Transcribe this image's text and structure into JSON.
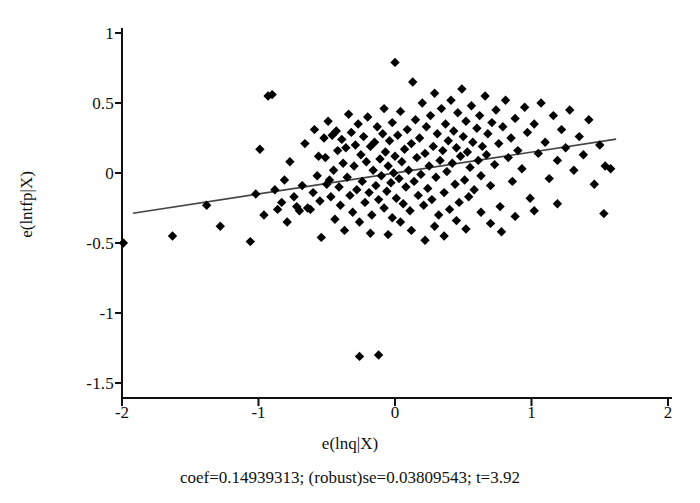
{
  "figure": {
    "width": 700,
    "height": 503,
    "background": "#ffffff",
    "ink_color": "#111111"
  },
  "axes": {
    "x_label": "e(lnq|X)",
    "y_label": "e(lntfp|X)",
    "x_ticks": [
      "-2",
      "-1",
      "0",
      "1",
      "2"
    ],
    "y_ticks": [
      "1",
      "0.5",
      "0",
      "-0.5",
      "-1",
      "-1.5"
    ]
  },
  "caption": {
    "text": "coef=0.14939313; (robust)se=0.03809543; t=3.92"
  },
  "chart_data": {
    "type": "scatter",
    "title": "",
    "xlabel": "e(lnq|X)",
    "ylabel": "e(lntfp|X)",
    "xlim": [
      -2,
      2
    ],
    "ylim": [
      -1.5,
      1
    ],
    "xticks": [
      -2,
      -1,
      0,
      1,
      2
    ],
    "yticks": [
      1,
      0.5,
      0,
      -0.5,
      -1,
      -1.5
    ],
    "grid": false,
    "legend": false,
    "marker": "diamond",
    "marker_color": "#000000",
    "marker_size": 7,
    "fit_line": {
      "type": "linear",
      "coef": 0.14939313,
      "robust_se": 0.03809543,
      "t": 3.92,
      "intercept": 0.0,
      "color": "#444444",
      "x_start": -1.92,
      "x_end": 1.62,
      "y_start": -0.287,
      "y_end": 0.242
    },
    "series": [
      {
        "name": "partial residuals",
        "n": 196,
        "points": [
          [
            -1.99,
            -0.5
          ],
          [
            -1.63,
            -0.45
          ],
          [
            -1.38,
            -0.23
          ],
          [
            -1.28,
            -0.38
          ],
          [
            -1.06,
            -0.49
          ],
          [
            -1.02,
            -0.15
          ],
          [
            -0.99,
            0.17
          ],
          [
            -0.96,
            -0.3
          ],
          [
            -0.93,
            0.55
          ],
          [
            -0.9,
            0.56
          ],
          [
            -0.88,
            -0.12
          ],
          [
            -0.86,
            -0.26
          ],
          [
            -0.83,
            -0.21
          ],
          [
            -0.81,
            -0.05
          ],
          [
            -0.79,
            -0.35
          ],
          [
            -0.77,
            0.08
          ],
          [
            -0.74,
            -0.17
          ],
          [
            -0.72,
            -0.24
          ],
          [
            -0.7,
            -0.27
          ],
          [
            -0.68,
            -0.09
          ],
          [
            -0.66,
            0.21
          ],
          [
            -0.64,
            -0.25
          ],
          [
            -0.62,
            -0.26
          ],
          [
            -0.6,
            -0.14
          ],
          [
            -0.59,
            0.31
          ],
          [
            -0.57,
            -0.02
          ],
          [
            -0.56,
            0.12
          ],
          [
            -0.55,
            -0.2
          ],
          [
            -0.54,
            -0.46
          ],
          [
            -0.52,
            0.25
          ],
          [
            -0.51,
            0.11
          ],
          [
            -0.5,
            -0.08
          ],
          [
            -0.49,
            0.37
          ],
          [
            -0.48,
            -0.05
          ],
          [
            -0.47,
            -0.17
          ],
          [
            -0.46,
            0.27
          ],
          [
            -0.45,
            0.02
          ],
          [
            -0.44,
            -0.33
          ],
          [
            -0.43,
            0.3
          ],
          [
            -0.42,
            0.16
          ],
          [
            -0.41,
            -0.1
          ],
          [
            -0.4,
            -0.23
          ],
          [
            -0.39,
            0.24
          ],
          [
            -0.38,
            0.07
          ],
          [
            -0.37,
            -0.41
          ],
          [
            -0.36,
            0.18
          ],
          [
            -0.35,
            -0.03
          ],
          [
            -0.34,
            0.42
          ],
          [
            -0.33,
            -0.16
          ],
          [
            -0.32,
            0.29
          ],
          [
            -0.31,
            -0.28
          ],
          [
            -0.3,
            0.05
          ],
          [
            -0.29,
            0.2
          ],
          [
            -0.28,
            -0.12
          ],
          [
            -0.27,
            0.35
          ],
          [
            -0.26,
            -0.35
          ],
          [
            -0.26,
            -1.31
          ],
          [
            -0.25,
            0.13
          ],
          [
            -0.24,
            -0.06
          ],
          [
            -0.23,
            0.26
          ],
          [
            -0.22,
            -0.21
          ],
          [
            -0.21,
            0.08
          ],
          [
            -0.2,
            0.4
          ],
          [
            -0.19,
            -0.14
          ],
          [
            -0.18,
            0.19
          ],
          [
            -0.17,
            -0.3
          ],
          [
            -0.16,
            0.02
          ],
          [
            -0.15,
            0.22
          ],
          [
            -0.14,
            -0.09
          ],
          [
            -0.13,
            0.33
          ],
          [
            -0.12,
            -0.19
          ],
          [
            -0.12,
            -1.3
          ],
          [
            -0.11,
            0.1
          ],
          [
            -0.1,
            -0.02
          ],
          [
            -0.09,
            0.28
          ],
          [
            -0.08,
            -0.25
          ],
          [
            -0.08,
            0.46
          ],
          [
            -0.07,
            0.15
          ],
          [
            -0.06,
            -0.13
          ],
          [
            -0.05,
            0.05
          ],
          [
            -0.04,
            0.23
          ],
          [
            -0.03,
            -0.07
          ],
          [
            -0.02,
            0.36
          ],
          [
            -0.02,
            -0.32
          ],
          [
            -0.01,
            0.0
          ],
          [
            0.0,
            0.79
          ],
          [
            0.0,
            0.12
          ],
          [
            0.01,
            -0.18
          ],
          [
            0.02,
            0.27
          ],
          [
            0.03,
            -0.04
          ],
          [
            0.04,
            0.44
          ],
          [
            0.05,
            0.08
          ],
          [
            0.06,
            -0.22
          ],
          [
            0.07,
            0.17
          ],
          [
            0.08,
            -0.1
          ],
          [
            0.09,
            0.31
          ],
          [
            0.1,
            0.02
          ],
          [
            0.11,
            -0.27
          ],
          [
            0.12,
            0.21
          ],
          [
            0.13,
            0.65
          ],
          [
            0.14,
            -0.06
          ],
          [
            0.15,
            0.38
          ],
          [
            0.16,
            0.11
          ],
          [
            0.17,
            -0.16
          ],
          [
            0.18,
            0.25
          ],
          [
            0.19,
            -0.01
          ],
          [
            0.2,
            0.5
          ],
          [
            0.21,
            -0.23
          ],
          [
            0.22,
            0.14
          ],
          [
            0.23,
            0.33
          ],
          [
            0.24,
            -0.11
          ],
          [
            0.25,
            0.05
          ],
          [
            0.26,
            0.41
          ],
          [
            0.27,
            -0.19
          ],
          [
            0.28,
            0.19
          ],
          [
            0.29,
            0.57
          ],
          [
            0.3,
            -0.03
          ],
          [
            0.31,
            0.28
          ],
          [
            0.32,
            -0.3
          ],
          [
            0.33,
            0.09
          ],
          [
            0.34,
            0.46
          ],
          [
            0.35,
            0.16
          ],
          [
            0.36,
            -0.14
          ],
          [
            0.37,
            0.35
          ],
          [
            0.38,
            0.01
          ],
          [
            0.39,
            0.23
          ],
          [
            0.4,
            -0.26
          ],
          [
            0.41,
            0.52
          ],
          [
            0.42,
            0.07
          ],
          [
            0.43,
            0.3
          ],
          [
            0.44,
            -0.08
          ],
          [
            0.45,
            0.18
          ],
          [
            0.46,
            0.43
          ],
          [
            0.47,
            -0.21
          ],
          [
            0.48,
            0.12
          ],
          [
            0.49,
            0.6
          ],
          [
            0.5,
            0.26
          ],
          [
            0.51,
            -0.05
          ],
          [
            0.52,
            0.37
          ],
          [
            0.53,
            0.15
          ],
          [
            0.54,
            -0.17
          ],
          [
            0.55,
            0.04
          ],
          [
            0.56,
            0.48
          ],
          [
            0.57,
            0.22
          ],
          [
            0.58,
            -0.12
          ],
          [
            0.6,
            0.32
          ],
          [
            0.61,
            0.09
          ],
          [
            0.62,
            0.41
          ],
          [
            0.63,
            -0.02
          ],
          [
            0.64,
            0.19
          ],
          [
            0.66,
            0.55
          ],
          [
            0.67,
            0.13
          ],
          [
            0.68,
            0.28
          ],
          [
            0.7,
            -0.09
          ],
          [
            0.71,
            0.36
          ],
          [
            0.73,
            0.06
          ],
          [
            0.74,
            0.45
          ],
          [
            0.76,
            0.21
          ],
          [
            0.77,
            -0.24
          ],
          [
            0.79,
            0.33
          ],
          [
            0.81,
            0.52
          ],
          [
            0.83,
            0.11
          ],
          [
            0.85,
            0.25
          ],
          [
            0.86,
            -0.06
          ],
          [
            0.88,
            0.39
          ],
          [
            0.9,
            0.16
          ],
          [
            0.93,
            0.03
          ],
          [
            0.95,
            0.47
          ],
          [
            0.97,
            0.29
          ],
          [
            0.99,
            -0.18
          ],
          [
            1.02,
            0.35
          ],
          [
            1.05,
            0.14
          ],
          [
            1.07,
            0.5
          ],
          [
            1.1,
            0.22
          ],
          [
            1.13,
            -0.04
          ],
          [
            1.16,
            0.41
          ],
          [
            1.19,
            0.09
          ],
          [
            1.22,
            0.31
          ],
          [
            1.25,
            0.18
          ],
          [
            1.28,
            0.45
          ],
          [
            1.31,
            0.02
          ],
          [
            1.35,
            0.26
          ],
          [
            1.38,
            0.13
          ],
          [
            1.42,
            0.38
          ],
          [
            1.46,
            -0.08
          ],
          [
            1.5,
            0.2
          ],
          [
            1.54,
            0.05
          ],
          [
            1.58,
            0.03
          ],
          [
            1.53,
            -0.29
          ],
          [
            1.19,
            -0.22
          ],
          [
            0.88,
            -0.31
          ],
          [
            0.63,
            -0.28
          ],
          [
            0.45,
            -0.34
          ],
          [
            0.29,
            -0.38
          ],
          [
            0.12,
            -0.41
          ],
          [
            -0.05,
            -0.44
          ],
          [
            0.36,
            -0.45
          ],
          [
            0.52,
            -0.4
          ],
          [
            0.7,
            -0.36
          ],
          [
            0.22,
            -0.48
          ],
          [
            0.04,
            -0.35
          ],
          [
            -0.18,
            -0.43
          ],
          [
            1.02,
            -0.27
          ],
          [
            0.78,
            -0.42
          ]
        ]
      }
    ]
  }
}
